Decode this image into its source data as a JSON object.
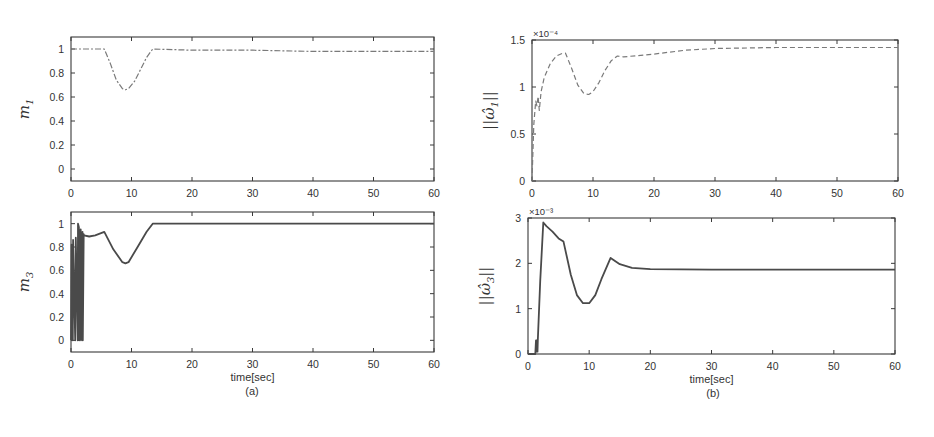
{
  "figure": {
    "caption_a": "(a)",
    "caption_b": "(b)",
    "xlabel": "time[sec]",
    "colors": {
      "axis": "#3a3a3a",
      "line": "#4a4a4a",
      "dashed": "#7a7a7a",
      "background": "#ffffff"
    }
  },
  "chart_data": [
    {
      "id": "m1",
      "type": "line",
      "panel": "(a) top",
      "ylabel": "m_1",
      "ylabel_main": "m",
      "ylabel_sub": "1",
      "xlabel": "",
      "xlim": [
        0,
        60
      ],
      "ylim": [
        -0.1,
        1.1
      ],
      "xticks": [
        0,
        10,
        20,
        30,
        40,
        50,
        60
      ],
      "yticks": [
        0,
        0.2,
        0.4,
        0.6,
        0.8,
        1
      ],
      "ytick_labels": [
        "0",
        "0.2",
        "0.4",
        "0.6",
        "0.8",
        "1"
      ],
      "exponent": "",
      "line_style": "dash-dot",
      "box": {
        "x0": 71,
        "y0": 37,
        "x1": 434,
        "y1": 181
      },
      "x": [
        0,
        5.5,
        6.5,
        7.5,
        8.5,
        9,
        9.5,
        10.5,
        11.5,
        12.5,
        13.5,
        20,
        30,
        40,
        50,
        60
      ],
      "y": [
        1,
        1,
        0.88,
        0.74,
        0.67,
        0.66,
        0.67,
        0.73,
        0.83,
        0.93,
        1,
        0.99,
        0.99,
        0.98,
        0.98,
        0.98
      ]
    },
    {
      "id": "m3",
      "type": "line",
      "panel": "(a) bottom",
      "ylabel": "m_3",
      "ylabel_main": "m",
      "ylabel_sub": "3",
      "xlabel": "time[sec]",
      "xlim": [
        0,
        60
      ],
      "ylim": [
        -0.1,
        1.1
      ],
      "xticks": [
        0,
        10,
        20,
        30,
        40,
        50,
        60
      ],
      "yticks": [
        0,
        0.2,
        0.4,
        0.6,
        0.8,
        1
      ],
      "ytick_labels": [
        "0",
        "0.2",
        "0.4",
        "0.6",
        "0.8",
        "1"
      ],
      "exponent": "",
      "line_style": "solid",
      "box": {
        "x0": 71,
        "y0": 212,
        "x1": 434,
        "y1": 352
      },
      "x": [
        0,
        0.1,
        0.3,
        0.35,
        0.7,
        0.8,
        1.1,
        1.15,
        1.3,
        1.35,
        1.6,
        1.65,
        1.9,
        1.95,
        2.1,
        2.15,
        3,
        4,
        5.5,
        7,
        8.5,
        9,
        9.5,
        11,
        12.5,
        13.5,
        20,
        30,
        40,
        50,
        60
      ],
      "y": [
        0,
        0.82,
        0,
        0.86,
        0,
        0.88,
        0,
        1.0,
        0.97,
        0,
        0.95,
        0,
        0.93,
        0,
        0.91,
        0.9,
        0.89,
        0.9,
        0.93,
        0.78,
        0.67,
        0.66,
        0.67,
        0.8,
        0.93,
        1,
        1,
        1,
        1,
        1,
        1
      ]
    },
    {
      "id": "omega1",
      "type": "line",
      "panel": "(b) top",
      "ylabel": "||ω̂_1||",
      "ylabel_main": "||ω̂",
      "ylabel_sub": "1",
      "xlabel": "",
      "xlim": [
        0,
        60
      ],
      "ylim": [
        0,
        1.5
      ],
      "xticks": [
        0,
        10,
        20,
        30,
        40,
        50,
        60
      ],
      "yticks": [
        0,
        0.5,
        1,
        1.5
      ],
      "ytick_labels": [
        "0",
        "0.5",
        "1",
        "1.5"
      ],
      "exponent": "×10⁻⁴",
      "line_style": "dashed",
      "box": {
        "x0": 532,
        "y0": 40,
        "x1": 898,
        "y1": 181
      },
      "x": [
        0,
        0.3,
        0.6,
        0.8,
        1.0,
        1.2,
        1.5,
        2,
        3,
        4,
        5,
        5.5,
        6.5,
        7.5,
        8.5,
        9.3,
        10,
        11,
        12,
        13,
        14,
        15,
        20,
        25,
        30,
        40,
        50,
        60
      ],
      "y": [
        0,
        0.6,
        0.85,
        0.8,
        0.9,
        0.75,
        0.95,
        1.1,
        1.25,
        1.33,
        1.36,
        1.36,
        1.2,
        1.02,
        0.93,
        0.92,
        0.95,
        1.05,
        1.18,
        1.28,
        1.33,
        1.32,
        1.35,
        1.39,
        1.41,
        1.42,
        1.42,
        1.42
      ]
    },
    {
      "id": "omega3",
      "type": "line",
      "panel": "(b) bottom",
      "ylabel": "||ω̂_3||",
      "ylabel_main": "||ω̂",
      "ylabel_sub": "3",
      "xlabel": "time[sec]",
      "xlim": [
        0,
        60
      ],
      "ylim": [
        0,
        3
      ],
      "xticks": [
        0,
        10,
        20,
        30,
        40,
        50,
        60
      ],
      "yticks": [
        0,
        1,
        2,
        3
      ],
      "ytick_labels": [
        "0",
        "1",
        "2",
        "3"
      ],
      "exponent": "×10⁻³",
      "line_style": "solid",
      "box": {
        "x0": 528,
        "y0": 218,
        "x1": 895,
        "y1": 354
      },
      "x": [
        0,
        1.2,
        1.3,
        1.35,
        1.4,
        1.45,
        1.5,
        1.55,
        1.6,
        2.0,
        2.5,
        3,
        4,
        5,
        5.8,
        7,
        8,
        9,
        10,
        11,
        12,
        13.5,
        15,
        17,
        20,
        30,
        40,
        50,
        60
      ],
      "y": [
        0,
        0,
        0.3,
        0.05,
        0.3,
        0.05,
        0.3,
        0.05,
        0.3,
        1.6,
        2.9,
        2.82,
        2.7,
        2.55,
        2.48,
        1.75,
        1.3,
        1.12,
        1.12,
        1.3,
        1.65,
        2.12,
        1.98,
        1.9,
        1.87,
        1.86,
        1.86,
        1.86,
        1.86
      ]
    }
  ]
}
